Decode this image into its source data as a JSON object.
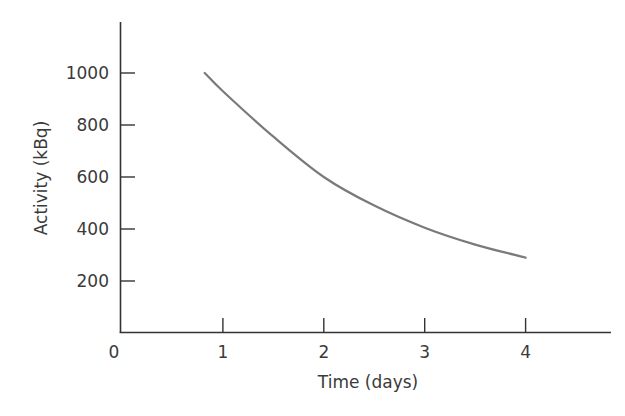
{
  "chart_data": {
    "type": "line",
    "title": "",
    "xlabel": "Time (days)",
    "ylabel": "Activity (kBq)",
    "xlim": [
      0,
      4.85
    ],
    "ylim": [
      0,
      1180
    ],
    "xticks": [
      0,
      1,
      2,
      3,
      4
    ],
    "yticks": [
      200,
      400,
      600,
      800,
      1000
    ],
    "x_tick_labels": [
      "0",
      "1",
      "2",
      "3",
      "4"
    ],
    "y_tick_labels": [
      "200",
      "400",
      "600",
      "800",
      "1000"
    ],
    "grid": false,
    "legend": null,
    "series": [
      {
        "name": "Activity",
        "color": "#7a7a7a",
        "x": [
          0.82,
          1.0,
          1.5,
          2.0,
          2.5,
          3.0,
          3.5,
          4.0
        ],
        "y": [
          1000,
          930,
          755,
          600,
          490,
          405,
          340,
          290
        ]
      }
    ]
  },
  "colors": {
    "axis": "#333333",
    "text": "#3a3a3a",
    "curve": "#7a7a7a"
  },
  "caption": "Figure"
}
